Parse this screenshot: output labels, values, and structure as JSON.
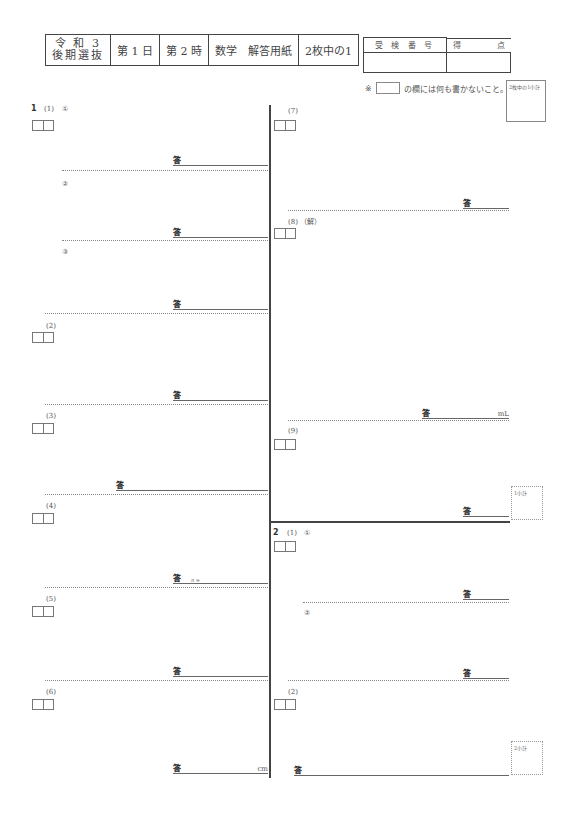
{
  "header": {
    "cells": [
      "令 和 3\n後期選抜",
      "第 1 日",
      "第 2 時",
      "数学　解答用紙",
      "2枚中の1"
    ]
  },
  "score_table": {
    "col1": "受 検 番 号",
    "col2": "得",
    "col2b": "点",
    "examinee_number": "",
    "score": ""
  },
  "note": {
    "mark": "※",
    "text": "の欄には何も書かないこと。"
  },
  "subtotals": {
    "page": "2枚中の1小計",
    "q1": "1小計",
    "q2": "2小計"
  },
  "answer_mark": "答",
  "question1": {
    "number": "1",
    "items": [
      {
        "label": "(1)",
        "sub": "①",
        "answer": "",
        "unit": ""
      },
      {
        "label": "",
        "sub": "②",
        "answer": "",
        "unit": ""
      },
      {
        "label": "",
        "sub": "③",
        "answer": "",
        "unit": ""
      },
      {
        "label": "(2)",
        "sub": "",
        "answer": "",
        "unit": ""
      },
      {
        "label": "(3)",
        "sub": "",
        "answer": "",
        "unit": ""
      },
      {
        "label": "(4)",
        "sub": "",
        "answer": "",
        "prefix": "n =",
        "unit": ""
      },
      {
        "label": "(5)",
        "sub": "",
        "answer": "",
        "unit": ""
      },
      {
        "label": "(6)",
        "sub": "",
        "answer": "",
        "unit": "cm"
      },
      {
        "label": "(7)",
        "sub": "",
        "answer": "",
        "unit": ""
      },
      {
        "label": "(8)",
        "sub": "（解）",
        "answer": "",
        "unit": "mL"
      },
      {
        "label": "(9)",
        "sub": "",
        "answer": "",
        "unit": ""
      }
    ]
  },
  "question2": {
    "number": "2",
    "items": [
      {
        "label": "(1)",
        "sub": "①",
        "answer": "",
        "unit": ""
      },
      {
        "label": "",
        "sub": "②",
        "answer": "",
        "unit": ""
      },
      {
        "label": "(2)",
        "sub": "",
        "answer": "",
        "unit": ""
      }
    ]
  }
}
